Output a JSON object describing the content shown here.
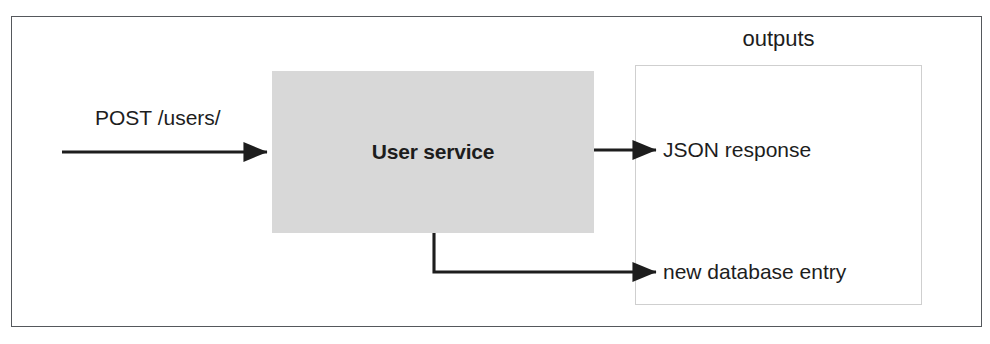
{
  "figure": {
    "colors": {
      "frame": "#55585c",
      "service_fill": "#d8d8d8",
      "group_border": "#cfcfcf",
      "arrow": "#1d1d1d",
      "text": "#1d1d1d"
    }
  },
  "input": {
    "label": "POST /users/"
  },
  "service": {
    "label": "User service"
  },
  "outputs": {
    "caption": "outputs",
    "items": [
      {
        "label": "JSON response"
      },
      {
        "label": "new database entry"
      }
    ]
  },
  "arrows": [
    {
      "name": "request-arrow",
      "from": "left-edge",
      "to": "user-service"
    },
    {
      "name": "json-response-arrow",
      "from": "user-service",
      "to": "json-response"
    },
    {
      "name": "database-entry-arrow",
      "from": "user-service",
      "to": "new-database-entry"
    }
  ]
}
